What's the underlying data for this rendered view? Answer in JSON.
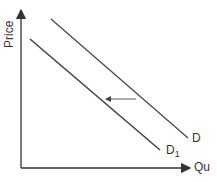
{
  "diagram": {
    "y_axis_label": "Price",
    "x_axis_label": "Qu",
    "curves": [
      {
        "name": "D",
        "from": [
          51,
          19
        ],
        "to": [
          188,
          138
        ]
      },
      {
        "name": "D",
        "subscript": "1",
        "from": [
          30,
          39
        ],
        "to": [
          160,
          150
        ]
      }
    ],
    "shift_arrow": {
      "from": [
        136,
        99
      ],
      "to": [
        105,
        99
      ],
      "direction": "left"
    },
    "colors": {
      "line": "#444444",
      "background": "#ffffff"
    }
  }
}
